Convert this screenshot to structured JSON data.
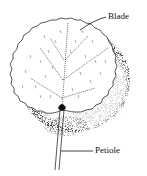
{
  "diagram": {
    "labels": {
      "blade": "Blade",
      "petiole": "Petiole"
    },
    "colors": {
      "ink": "#111111",
      "background": "#ffffff",
      "shadow": "#222222"
    }
  }
}
